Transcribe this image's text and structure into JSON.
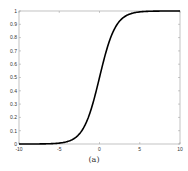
{
  "chart_data": {
    "type": "line",
    "title": "",
    "xlabel": "",
    "ylabel": "",
    "xlim": [
      -10,
      10
    ],
    "ylim": [
      0,
      1
    ],
    "grid": false,
    "legend": null,
    "x_ticks": [
      "-10",
      "-5",
      "0",
      "5",
      "10"
    ],
    "y_ticks": [
      "0",
      "0.1",
      "0.2",
      "0.3",
      "0.4",
      "0.5",
      "0.6",
      "0.7",
      "0.8",
      "0.9",
      "1"
    ],
    "series": [
      {
        "name": "sigmoid",
        "function": "1/(1+exp(-x))",
        "x": [
          -10,
          -8,
          -6,
          -5,
          -4,
          -3,
          -2,
          -1,
          0,
          1,
          2,
          3,
          4,
          5,
          6,
          8,
          10
        ],
        "values": [
          0.0,
          0.0003,
          0.0025,
          0.0067,
          0.018,
          0.047,
          0.119,
          0.269,
          0.5,
          0.731,
          0.881,
          0.953,
          0.982,
          0.993,
          0.9975,
          0.9997,
          1.0
        ],
        "color": "#000000"
      }
    ],
    "caption": "(a)"
  }
}
